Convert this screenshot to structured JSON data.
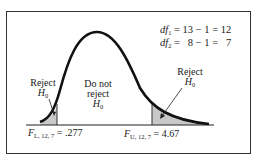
{
  "df": {
    "line1": {
      "label": "df",
      "sub": "1",
      "expr": " = 13 − 1 = 12"
    },
    "line2": {
      "label": "df",
      "sub": "2",
      "expr": " =   8 − 1 =   7"
    }
  },
  "regions": {
    "left": {
      "line1": "Reject",
      "h": "H",
      "hsub": "0"
    },
    "middle": {
      "line1": "Do not",
      "line2": "reject",
      "h": "H",
      "hsub": "0"
    },
    "right": {
      "line1": "Reject",
      "h": "H",
      "hsub": "0"
    }
  },
  "critical": {
    "lower": {
      "label": "F",
      "sub": "L, 12, 7",
      "value": " = .277"
    },
    "upper": {
      "label": "F",
      "sub": "U, 12, 7",
      "value": " = 4.67"
    }
  },
  "colors": {
    "shade": "#c8c8c8",
    "curve": "#111111"
  }
}
